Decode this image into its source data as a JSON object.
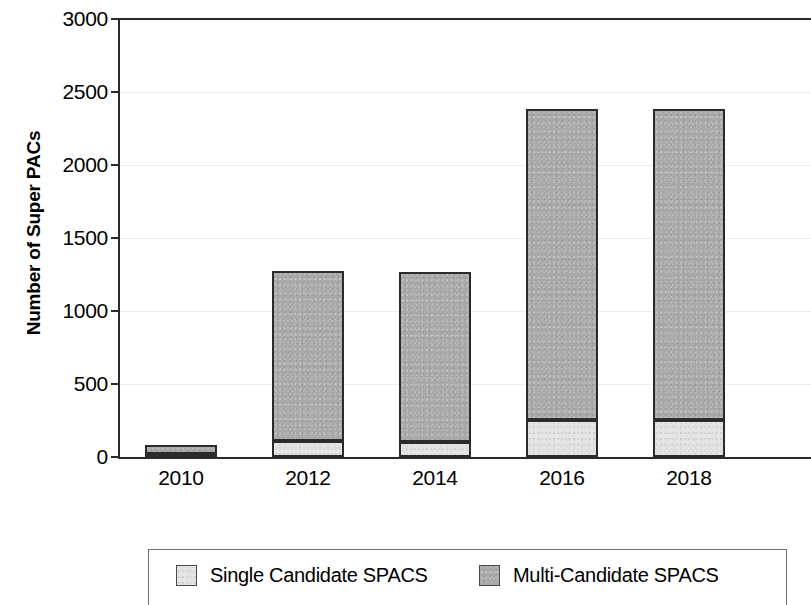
{
  "chart_data": {
    "type": "bar",
    "subtype": "stacked-bar",
    "title": "",
    "xlabel": "",
    "ylabel": "Number of Super PACs",
    "categories": [
      "2010",
      "2012",
      "2014",
      "2016",
      "2018"
    ],
    "series": [
      {
        "name": "Single Candidate SPACS",
        "color": "#e4e4e4",
        "values": [
          20,
          109,
          105,
          252,
          252
        ]
      },
      {
        "name": "Multi-Candidate SPACS",
        "color": "#a9a9a9",
        "values": [
          64,
          1165,
          1165,
          2135,
          2135
        ]
      }
    ],
    "totals": [
      84,
      1274,
      1270,
      2387,
      2387
    ],
    "ylim": [
      0,
      3000
    ],
    "yticks": [
      0,
      500,
      1000,
      1500,
      2000,
      2500,
      3000
    ],
    "ytick_labels": [
      "0",
      "500",
      "1000",
      "1500",
      "2000",
      "2500",
      "3000"
    ],
    "grid": true,
    "grid_axis": "y",
    "legend_position": "bottom",
    "note": "plot area is cropped at the right edge of the screenshot"
  },
  "axes": {
    "y_title": "Number of Super PACs",
    "y_ticks": [
      {
        "label": "3000",
        "value": 3000
      },
      {
        "label": "2500",
        "value": 2500
      },
      {
        "label": "2000",
        "value": 2000
      },
      {
        "label": "1500",
        "value": 1500
      },
      {
        "label": "1000",
        "value": 1000
      },
      {
        "label": "500",
        "value": 500
      },
      {
        "label": "0",
        "value": 0
      }
    ],
    "x_ticks": [
      {
        "label": "2010"
      },
      {
        "label": "2012"
      },
      {
        "label": "2014"
      },
      {
        "label": "2016"
      },
      {
        "label": "2018"
      }
    ]
  },
  "legend": {
    "items": [
      {
        "label": "Single Candidate SPACS",
        "color": "#e4e4e4"
      },
      {
        "label": "Multi-Candidate SPACS",
        "color": "#a9a9a9"
      }
    ]
  }
}
